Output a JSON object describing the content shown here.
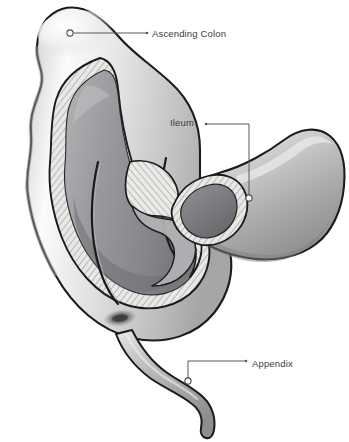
{
  "figure": {
    "background_color": "#ffffff",
    "width": 349,
    "height": 442
  },
  "labels": [
    {
      "id": "ascending-colon",
      "text": "Ascending Colon",
      "text_color": "#3a3a3a",
      "anchor_marker": "open-circle",
      "anchor_x": 70,
      "anchor_y": 33,
      "leader_shape": "horizontal",
      "arrow_tip_x": 146,
      "arrow_tip_y": 33
    },
    {
      "id": "ileum",
      "text": "Ileum",
      "text_color": "#3a3a3a",
      "anchor_marker": "open-circle",
      "anchor_x": 249,
      "anchor_y": 198,
      "leader_shape": "horizontal-then-down",
      "arrow_tip_x": 206,
      "arrow_tip_y": 124
    },
    {
      "id": "appendix",
      "text": "Appendix",
      "text_color": "#3a3a3a",
      "anchor_marker": "open-circle",
      "anchor_x": 188,
      "anchor_y": 381,
      "leader_shape": "up-then-horizontal",
      "arrow_tip_x": 246,
      "arrow_tip_y": 361
    }
  ],
  "anatomy": {
    "parts": [
      {
        "name": "ascending-colon",
        "description": "Haustrated colon shown in cutaway at upper left"
      },
      {
        "name": "cecum",
        "description": "Pouch forming the lower body of the cutaway"
      },
      {
        "name": "ileum",
        "description": "Small intestine tube entering from the right, cut open at its end"
      },
      {
        "name": "ileocecal-valve",
        "description": "Paired lips where the ileum opens into the cecum"
      },
      {
        "name": "appendiceal-orifice",
        "description": "Dark oval opening on the cecal floor"
      },
      {
        "name": "appendix",
        "description": "Narrow S-curved tube descending from the cecum"
      }
    ]
  },
  "palette": {
    "background": "#ffffff",
    "outline": "#1b1b1b",
    "serosa_light": "#d8d8d8",
    "serosa_mid": "#b9b9b9",
    "highlight": "#fdfdfd",
    "muscular_hatch_base": "#e4e4e2",
    "muscular_hatch_line": "#9a9a96",
    "mucosa_mid": "#9a9a9e",
    "lumen_dark": "#6f7074",
    "lumen_deep": "#4c4d51",
    "label_text": "#3a3a3a",
    "leader_line": "#59595c"
  }
}
